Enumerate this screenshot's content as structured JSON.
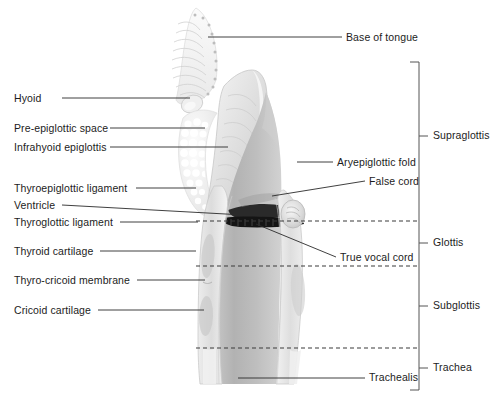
{
  "figure": {
    "background_color": "#ffffff",
    "illustration": {
      "style": "grayscale anatomical sagittal cutaway of larynx",
      "tissue_light": "#f1f1f1",
      "tissue_mid": "#d8d8d8",
      "tissue_dark": "#b9b9b9",
      "cord_color": "#1f1f1f",
      "outline_color": "#9a9a9a"
    },
    "leader_line_color": "#2a2a2a",
    "dashed_line_color": "#3a3a3a",
    "bracket_color": "#555555"
  },
  "labels_left": [
    {
      "id": "hyoid",
      "text": "Hyoid",
      "x": 14,
      "y": 93,
      "leader": {
        "x1": 62,
        "y1": 98,
        "x2": 190,
        "y2": 98
      }
    },
    {
      "id": "pre-epiglottic-space",
      "text": "Pre-epiglottic space",
      "x": 14,
      "y": 123,
      "leader": {
        "x1": 110,
        "y1": 128,
        "x2": 205,
        "y2": 128
      }
    },
    {
      "id": "infrahyoid-epiglottis",
      "text": "Infrahyoid epiglottis",
      "x": 14,
      "y": 142,
      "leader": {
        "x1": 110,
        "y1": 147,
        "x2": 228,
        "y2": 147
      }
    },
    {
      "id": "thyroepiglottic-ligament",
      "text": "Thyroepiglottic ligament",
      "x": 14,
      "y": 183,
      "leader": {
        "x1": 136,
        "y1": 188,
        "x2": 196,
        "y2": 188
      }
    },
    {
      "id": "ventricle",
      "text": "Ventricle",
      "x": 14,
      "y": 200,
      "leader": {
        "x1": 62,
        "y1": 205,
        "x2": 262,
        "y2": 216
      }
    },
    {
      "id": "thyroglottic-ligament",
      "text": "Thyroglottic ligament",
      "x": 14,
      "y": 217,
      "leader": {
        "x1": 120,
        "y1": 222,
        "x2": 198,
        "y2": 222
      }
    },
    {
      "id": "thyroid-cartilage",
      "text": "Thyroid cartilage",
      "x": 14,
      "y": 246,
      "leader": {
        "x1": 100,
        "y1": 251,
        "x2": 196,
        "y2": 251
      }
    },
    {
      "id": "thyro-cricoid-membrane",
      "text": "Thyro-cricoid membrane",
      "x": 14,
      "y": 275,
      "leader": {
        "x1": 137,
        "y1": 280,
        "x2": 205,
        "y2": 280
      }
    },
    {
      "id": "cricoid-cartilage",
      "text": "Cricoid cartilage",
      "x": 14,
      "y": 305,
      "leader": {
        "x1": 98,
        "y1": 310,
        "x2": 204,
        "y2": 310
      }
    }
  ],
  "labels_right": [
    {
      "id": "base-of-tongue",
      "text": "Base of tongue",
      "x": 346,
      "y": 32,
      "leader": {
        "x1": 208,
        "y1": 37,
        "x2": 342,
        "y2": 37
      }
    },
    {
      "id": "aryepiglottic-fold",
      "text": "Aryepiglottic fold",
      "x": 337,
      "y": 157,
      "leader": {
        "x1": 297,
        "y1": 162,
        "x2": 333,
        "y2": 162
      }
    },
    {
      "id": "false-cord",
      "text": "False cord",
      "x": 369,
      "y": 176,
      "leader": {
        "x1": 272,
        "y1": 196,
        "x2": 365,
        "y2": 181
      }
    },
    {
      "id": "true-vocal-cord",
      "text": "True vocal cord",
      "x": 340,
      "y": 252,
      "leader": {
        "x1": 256,
        "y1": 224,
        "x2": 336,
        "y2": 257
      }
    },
    {
      "id": "trachealis",
      "text": "Trachealis",
      "x": 369,
      "y": 372,
      "leader": {
        "x1": 238,
        "y1": 378,
        "x2": 365,
        "y2": 378
      }
    }
  ],
  "bracket": {
    "axis_x": 419,
    "top": 62,
    "bottom": 390,
    "tick_length": 9,
    "label_gap": 5,
    "divisions": [
      {
        "id": "supraglottis",
        "text": "Supraglottis",
        "start": 62,
        "end": 221,
        "tick_y": 136,
        "label_y": 130
      },
      {
        "id": "glottis",
        "text": "Glottis",
        "start": 221,
        "end": 266,
        "tick_y": 243,
        "label_y": 237
      },
      {
        "id": "subglottis",
        "text": "Subglottis",
        "start": 266,
        "end": 348,
        "tick_y": 306,
        "label_y": 300
      },
      {
        "id": "trachea",
        "text": "Trachea",
        "start": 348,
        "end": 390,
        "tick_y": 368,
        "label_y": 362
      }
    ]
  },
  "dashed_dividers": [
    {
      "id": "supraglottis-glottis-divider",
      "y": 221,
      "x1": 196,
      "x2": 419
    },
    {
      "id": "glottis-subglottis-divider",
      "y": 266,
      "x1": 196,
      "x2": 419
    },
    {
      "id": "subglottis-trachea-divider",
      "y": 348,
      "x1": 196,
      "x2": 419
    }
  ]
}
